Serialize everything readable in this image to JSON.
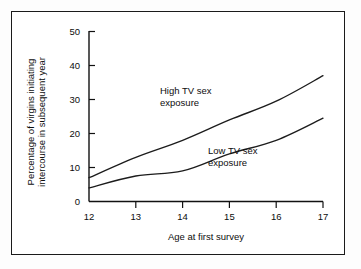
{
  "figure": {
    "alt_title": "Percentage of virgins initiating intercourse in subsequent year by age at first survey and TV sex exposure"
  },
  "chart_data": {
    "type": "line",
    "title": "",
    "subtitle": "",
    "xlabel": "Age at first survey",
    "ylabel": "Percentage of virgins initiating\nintercourse in subsequent year",
    "ylabel_line1": "Percentage of virgins initiating",
    "ylabel_line2": "intercourse in subsequent year",
    "x": [
      12,
      13,
      14,
      15,
      16,
      17
    ],
    "categories": [
      "12",
      "13",
      "14",
      "15",
      "16",
      "17"
    ],
    "xlim": [
      12,
      17
    ],
    "ylim": [
      0,
      50
    ],
    "xticks": [
      12,
      13,
      14,
      15,
      16,
      17
    ],
    "yticks": [
      0,
      10,
      20,
      30,
      40,
      50
    ],
    "xtick_labels": [
      "12",
      "13",
      "14",
      "15",
      "16",
      "17"
    ],
    "ytick_labels": [
      "0",
      "10",
      "20",
      "30",
      "40",
      "50"
    ],
    "grid": false,
    "legend_position": "inline-annotation",
    "series": [
      {
        "name": "High TV sex exposure",
        "label_line1": "High TV sex",
        "label_line2": "exposure",
        "color": "#1c1c1c",
        "values": [
          7,
          13,
          18,
          24,
          29.5,
          37
        ]
      },
      {
        "name": "Low TV sex exposure",
        "label_line1": "Low TV sex",
        "label_line2": "exposure",
        "color": "#1c1c1c",
        "values": [
          4,
          7.5,
          9,
          14,
          18,
          24.5
        ]
      }
    ],
    "annotations": [
      {
        "text": "High TV sex exposure",
        "x": 14.1,
        "y": 26.5
      },
      {
        "text": "Low TV sex exposure",
        "x": 15.2,
        "y": 11.5
      }
    ]
  },
  "colors": {
    "frame": "#1a1a1a",
    "axis": "#111111",
    "line": "#1c1c1c",
    "text": "#0d0d0d",
    "background": "#ffffff"
  }
}
